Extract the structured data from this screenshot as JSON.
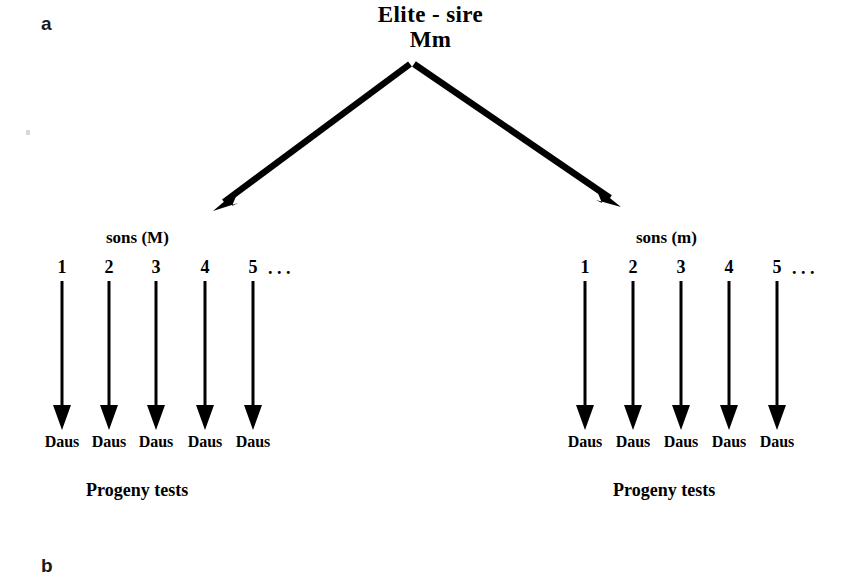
{
  "figure": {
    "panel_a_letter": "a",
    "panel_b_letter": "b",
    "root": {
      "line1": "Elite - sire",
      "line2": "Mm"
    },
    "ink_color": "#000000",
    "background_color": "#ffffff",
    "groups": [
      {
        "heading": "sons (M)",
        "ellipsis": ". . .",
        "caption": "Progeny tests",
        "sons": [
          {
            "number": "1",
            "daughters_label": "Daus"
          },
          {
            "number": "2",
            "daughters_label": "Daus"
          },
          {
            "number": "3",
            "daughters_label": "Daus"
          },
          {
            "number": "4",
            "daughters_label": "Daus"
          },
          {
            "number": "5",
            "daughters_label": "Daus"
          }
        ]
      },
      {
        "heading": "sons (m)",
        "ellipsis": ". . .",
        "caption": "Progeny tests",
        "sons": [
          {
            "number": "1",
            "daughters_label": "Daus"
          },
          {
            "number": "2",
            "daughters_label": "Daus"
          },
          {
            "number": "3",
            "daughters_label": "Daus"
          },
          {
            "number": "4",
            "daughters_label": "Daus"
          },
          {
            "number": "5",
            "daughters_label": "Daus"
          }
        ]
      }
    ]
  }
}
